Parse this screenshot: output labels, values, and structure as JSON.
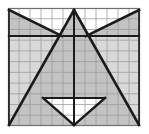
{
  "figure": {
    "type": "geometry-diagram",
    "canvas": {
      "width": 149,
      "height": 134
    },
    "background_color": "#ffffff",
    "grid": {
      "x_min": 8,
      "y_min": 8,
      "x_max": 140,
      "y_max": 126,
      "columns": 12,
      "rows": 11,
      "cell_width": 11,
      "cell_height": 10.7,
      "line_color": "#9a9a9a",
      "line_width": 0.8,
      "border_color": "#6f6f6f",
      "border_width": 1.2,
      "visible": true
    },
    "shading": {
      "fill_color": "#b9b9b9",
      "fill_opacity": 0.85,
      "unshaded_color": "#ffffff"
    },
    "stroke": {
      "color": "#1a1a1a",
      "width": 2.6,
      "thin_width": 2.0
    },
    "points": {
      "top_apex": [
        74,
        10
      ],
      "top_left_corner": [
        9,
        10
      ],
      "top_right_corner": [
        139,
        10
      ],
      "bottom_left_corner": [
        9,
        125
      ],
      "bottom_right_corner": [
        139,
        125
      ],
      "bottom_center": [
        74,
        125
      ],
      "left_mid": [
        9,
        36
      ],
      "right_mid": [
        139,
        36
      ],
      "left_notch": [
        43,
        98
      ],
      "right_notch": [
        105,
        98
      ],
      "left_wing_tip": [
        62,
        36
      ],
      "right_wing_tip": [
        86,
        36
      ],
      "center_vertical_top": [
        74,
        10
      ],
      "center_vertical_bottom": [
        74,
        125
      ]
    },
    "shapes": [
      {
        "name": "central-triangle",
        "kind": "triangle",
        "vertices": [
          [
            74,
            10
          ],
          [
            9,
            125
          ],
          [
            139,
            125
          ]
        ],
        "shaded": true
      },
      {
        "name": "top-left-wing-triangle",
        "kind": "triangle",
        "vertices": [
          [
            9,
            10
          ],
          [
            62,
            36
          ],
          [
            9,
            36
          ]
        ],
        "shaded": true
      },
      {
        "name": "top-right-wing-triangle",
        "kind": "triangle",
        "vertices": [
          [
            139,
            10
          ],
          [
            86,
            36
          ],
          [
            139,
            36
          ]
        ],
        "shaded": true
      },
      {
        "name": "bottom-center-notch",
        "kind": "triangle",
        "vertices": [
          [
            43,
            98
          ],
          [
            105,
            98
          ],
          [
            74,
            125
          ]
        ],
        "shaded": false
      }
    ],
    "segments": [
      {
        "name": "upper-horizontal-chord",
        "from": [
          9,
          36
        ],
        "to": [
          139,
          36
        ]
      },
      {
        "name": "lower-horizontal-chord",
        "from": [
          43,
          98
        ],
        "to": [
          105,
          98
        ]
      },
      {
        "name": "axis-of-symmetry",
        "from": [
          74,
          10
        ],
        "to": [
          74,
          125
        ]
      },
      {
        "name": "left-slope",
        "from": [
          74,
          10
        ],
        "to": [
          9,
          125
        ]
      },
      {
        "name": "right-slope",
        "from": [
          74,
          10
        ],
        "to": [
          139,
          125
        ]
      },
      {
        "name": "top-left-wing-hypotenuse",
        "from": [
          9,
          10
        ],
        "to": [
          62,
          36
        ]
      },
      {
        "name": "top-right-wing-hypotenuse",
        "from": [
          139,
          10
        ],
        "to": [
          86,
          36
        ]
      },
      {
        "name": "notch-left-edge",
        "from": [
          43,
          98
        ],
        "to": [
          74,
          125
        ]
      },
      {
        "name": "notch-right-edge",
        "from": [
          105,
          98
        ],
        "to": [
          74,
          125
        ]
      }
    ],
    "labels": []
  },
  "chart_data": {
    "type": "scatter",
    "xlabel": "",
    "ylabel": "",
    "xlim": [
      0,
      12
    ],
    "ylim": [
      0,
      11
    ],
    "grid": true,
    "legend": "none",
    "annotations": []
  }
}
